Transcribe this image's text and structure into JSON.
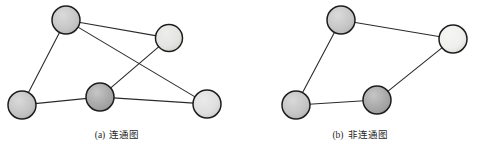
{
  "figure": {
    "background": "#ffffff",
    "edge_color": "#2b2b2b",
    "node_stroke": "#1c1c1c",
    "width": 477,
    "height": 150
  },
  "panels": [
    {
      "id": "panel-a",
      "caption_label": "(a)",
      "caption_title": "连通图",
      "caption_x": 57,
      "caption_y": 129,
      "nodes": [
        {
          "id": "a-n1",
          "name": "node-a-top-left",
          "cx": 66,
          "cy": 20,
          "r": 14,
          "fill": "#c4c4c4"
        },
        {
          "id": "a-n2",
          "name": "node-a-top-right",
          "cx": 169,
          "cy": 38,
          "r": 13.5,
          "fill": "#e3e3e0"
        },
        {
          "id": "a-n3",
          "name": "node-a-bottom-left",
          "cx": 22,
          "cy": 105,
          "r": 14,
          "fill": "#c2c2c2"
        },
        {
          "id": "a-n4",
          "name": "node-a-center-dark",
          "cx": 100,
          "cy": 97,
          "r": 14,
          "fill": "#a3a3a3"
        },
        {
          "id": "a-n5",
          "name": "node-a-bottom-right",
          "cx": 207,
          "cy": 104,
          "r": 14,
          "fill": "#dedede"
        }
      ],
      "edges": [
        {
          "name": "edge-a-topleft-topright",
          "from": "a-n1",
          "to": "a-n2"
        },
        {
          "name": "edge-a-topleft-bottomleft",
          "from": "a-n1",
          "to": "a-n3"
        },
        {
          "name": "edge-a-topleft-bottomright",
          "from": "a-n1",
          "to": "a-n5"
        },
        {
          "name": "edge-a-topright-centerdark",
          "from": "a-n2",
          "to": "a-n4"
        },
        {
          "name": "edge-a-bottomleft-centerdark",
          "from": "a-n3",
          "to": "a-n4"
        },
        {
          "name": "edge-a-centerdark-bottomright",
          "from": "a-n4",
          "to": "a-n5"
        }
      ]
    },
    {
      "id": "panel-b",
      "caption_label": "(b)",
      "caption_title": "非连通图",
      "caption_x": 300,
      "caption_y": 129,
      "nodes": [
        {
          "id": "b-n1",
          "name": "node-b-top",
          "cx": 341,
          "cy": 20,
          "r": 14,
          "fill": "#c4c4c4"
        },
        {
          "id": "b-n2",
          "name": "node-b-top-right",
          "cx": 453,
          "cy": 39,
          "r": 14,
          "fill": "#efefec"
        },
        {
          "id": "b-n3",
          "name": "node-b-bottom-left",
          "cx": 296,
          "cy": 105,
          "r": 14,
          "fill": "#c2c2c2"
        },
        {
          "id": "b-n4",
          "name": "node-b-bottom-dark",
          "cx": 377,
          "cy": 100,
          "r": 14,
          "fill": "#a3a3a3"
        }
      ],
      "edges": [
        {
          "name": "edge-b-top-topright",
          "from": "b-n1",
          "to": "b-n2"
        },
        {
          "name": "edge-b-top-bottomleft",
          "from": "b-n1",
          "to": "b-n3"
        },
        {
          "name": "edge-b-bottomleft-bottomdark",
          "from": "b-n3",
          "to": "b-n4"
        },
        {
          "name": "edge-b-bottomdark-topright",
          "from": "b-n4",
          "to": "b-n2"
        }
      ]
    }
  ]
}
